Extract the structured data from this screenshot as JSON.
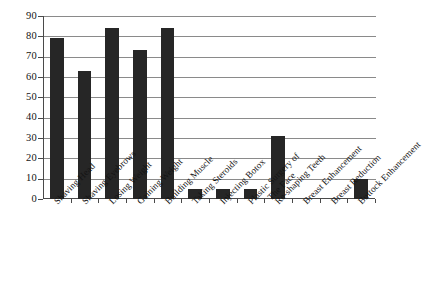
{
  "chart_data": {
    "type": "bar",
    "title": "",
    "subtitle": "",
    "xlabel": "",
    "ylabel": "",
    "ylim": [
      0,
      90
    ],
    "ytick_step": 10,
    "yticks": [
      90,
      80,
      70,
      60,
      50,
      40,
      30,
      20,
      10,
      0
    ],
    "grid": "horizontal",
    "legend": "none",
    "bar_color": "#262626",
    "axis_color": "#4a4a4a",
    "gridline_color": "#8a8a8a",
    "background_color": "#ffffff",
    "categories": [
      "Shaving Head",
      "Shaving Eyebrows",
      "Losing Weight",
      "Gaining Weight",
      "Building Muscle",
      "Taking Steroids",
      "Injecting Botox",
      "Plastic Surgery of The Face",
      "Re-shaping Teeth",
      "Breast Enhancement",
      "Breast Reduction",
      "Buttock Enhancement"
    ],
    "category_lines": [
      [
        "Shaving Head"
      ],
      [
        "Shaving Eyebrows"
      ],
      [
        "Losing Weight"
      ],
      [
        "Gaining Weight"
      ],
      [
        "Building Muscle"
      ],
      [
        "Taking Steroids"
      ],
      [
        "Injecting Botox"
      ],
      [
        "Plastic Surgery of",
        "The Face"
      ],
      [
        "Re-shaping Teeth"
      ],
      [
        "Breast Enhancement"
      ],
      [
        "Breast Reduction"
      ],
      [
        "Buttock Enhancement"
      ]
    ],
    "values": [
      79,
      63,
      84,
      73.5,
      84,
      5,
      5,
      5,
      31,
      0,
      0,
      10
    ]
  }
}
